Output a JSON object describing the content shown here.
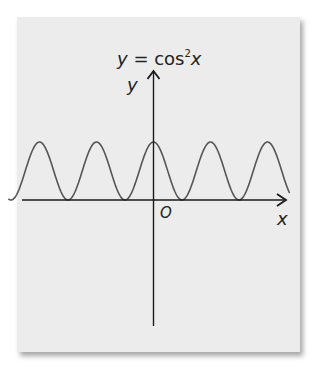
{
  "chart_data": {
    "type": "line",
    "title_parts": {
      "lhs": "y",
      "eq": " = cos",
      "sup": "2",
      "var": "x"
    },
    "xlabel": "x",
    "ylabel": "y",
    "origin_label": "O",
    "function": "cos^2(x)",
    "series": [
      {
        "name": "y = cos²x",
        "x_range": [
          -8.0,
          7.5
        ],
        "y_range": [
          0,
          1
        ]
      }
    ],
    "features": {
      "period": "pi",
      "maximum": 1,
      "minimum": 0,
      "peaks_visible": 3,
      "zeros_visible": 4
    },
    "grid": false,
    "legend": "none",
    "ticks": "none"
  },
  "colors": {
    "background": "#ececec",
    "axis": "#1a1a1a",
    "curve": "#555555"
  }
}
